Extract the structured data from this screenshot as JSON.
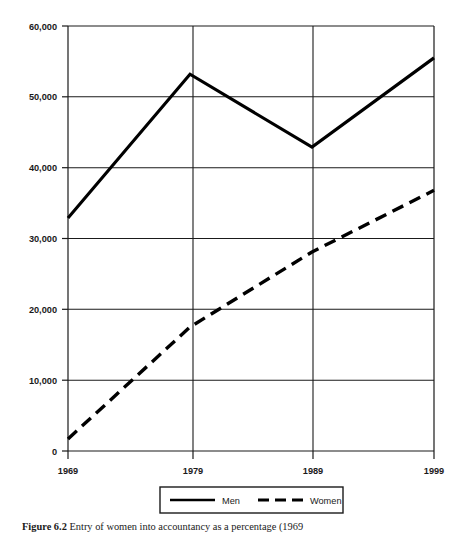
{
  "figure": {
    "caption_label": "Figure 6.2",
    "caption_text": "Entry of women into accountancy as a percentage (1969"
  },
  "chart_data": {
    "type": "line",
    "title": "",
    "xlabel": "",
    "ylabel": "",
    "categories": [
      "1969",
      "1979",
      "1989",
      "1999"
    ],
    "x_tick_labels": [
      "1969",
      "1979",
      "1989",
      "1999"
    ],
    "y_tick_labels": [
      "0",
      "10,000",
      "20,000",
      "30,000",
      "40,000",
      "50,000",
      "60,000"
    ],
    "y_tick_values": [
      0,
      10000,
      20000,
      30000,
      40000,
      50000,
      60000
    ],
    "ylim": [
      0,
      60000
    ],
    "grid": true,
    "legend_position": "bottom",
    "series": [
      {
        "name": "Men",
        "style": "solid",
        "color": "#000000",
        "values": [
          32900,
          53200,
          42900,
          55500
        ]
      },
      {
        "name": "Women",
        "style": "dashed",
        "color": "#000000",
        "values": [
          1700,
          17500,
          28100,
          36800
        ]
      }
    ]
  },
  "legend": {
    "items": [
      {
        "label": "Men",
        "style": "solid"
      },
      {
        "label": "Women",
        "style": "dashed"
      }
    ]
  }
}
